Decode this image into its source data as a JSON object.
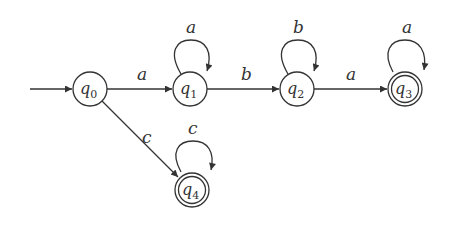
{
  "diagram": {
    "type": "finite-automaton",
    "states": [
      {
        "id": "q0",
        "name": "q",
        "sub": "0",
        "x": 90,
        "y": 89,
        "accepting": false,
        "initial": true
      },
      {
        "id": "q1",
        "name": "q",
        "sub": "1",
        "x": 190,
        "y": 89,
        "accepting": false,
        "initial": false
      },
      {
        "id": "q2",
        "name": "q",
        "sub": "2",
        "x": 297,
        "y": 89,
        "accepting": false,
        "initial": false
      },
      {
        "id": "q3",
        "name": "q",
        "sub": "3",
        "x": 405,
        "y": 89,
        "accepting": true,
        "initial": false
      },
      {
        "id": "q4",
        "name": "q",
        "sub": "4",
        "x": 192,
        "y": 190,
        "accepting": true,
        "initial": false
      }
    ],
    "transitions": [
      {
        "from": "q0",
        "to": "q1",
        "symbol": "a"
      },
      {
        "from": "q1",
        "to": "q1",
        "symbol": "a"
      },
      {
        "from": "q1",
        "to": "q2",
        "symbol": "b"
      },
      {
        "from": "q2",
        "to": "q2",
        "symbol": "b"
      },
      {
        "from": "q2",
        "to": "q3",
        "symbol": "a"
      },
      {
        "from": "q3",
        "to": "q3",
        "symbol": "a"
      },
      {
        "from": "q0",
        "to": "q4",
        "symbol": "c"
      },
      {
        "from": "q4",
        "to": "q4",
        "symbol": "c"
      }
    ],
    "labels": {
      "e_q0_q1": "a",
      "e_q1_loop": "a",
      "e_q1_q2": "b",
      "e_q2_loop": "b",
      "e_q2_q3": "a",
      "e_q3_loop": "a",
      "e_q0_q4": "c",
      "e_q4_loop": "c"
    },
    "state_names": {
      "q0": "q",
      "q0_sub": "0",
      "q1": "q",
      "q1_sub": "1",
      "q2": "q",
      "q2_sub": "2",
      "q3": "q",
      "q3_sub": "3",
      "q4": "q",
      "q4_sub": "4"
    },
    "colors": {
      "stroke": "#333333",
      "background": "#ffffff"
    }
  }
}
